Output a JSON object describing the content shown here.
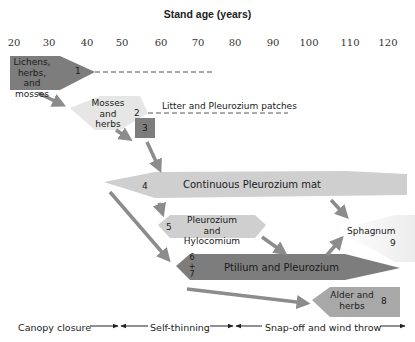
{
  "title": "Stand age (years)",
  "axis": {
    "ticks": [
      "20",
      "30",
      "40",
      "50",
      "60",
      "70",
      "80",
      "90",
      "100",
      "110",
      "120"
    ],
    "tick_x": [
      14,
      48,
      87,
      122,
      161,
      198,
      235,
      273,
      309,
      349,
      387
    ]
  },
  "colors": {
    "dark": "#7d7d7d",
    "medium": "#a8a8a8",
    "light": "#cfcfcf",
    "lightest": "#e6e6e6",
    "arrow": "#8c8c8c",
    "dashed": "#555555"
  },
  "stages": [
    {
      "id": "1",
      "label": "Lichens, herbs, and mosses",
      "number": "1",
      "shade": "dark"
    },
    {
      "id": "2",
      "label": "Mosses and herbs",
      "number": "2",
      "shade": "lightest"
    },
    {
      "id": "3",
      "label": "Litter and Pleurozium patches",
      "number": "3",
      "shade": "dark"
    },
    {
      "id": "4",
      "label": "Continuous Pleurozium mat",
      "number": "4",
      "shade": "light"
    },
    {
      "id": "5",
      "label": "Pleurozium and Hylocomium",
      "number": "5",
      "shade": "light"
    },
    {
      "id": "6+7",
      "label": "Ptilium and Pleurozium",
      "number": "6 + 7",
      "shade": "dark"
    },
    {
      "id": "8",
      "label": "Alder and herbs",
      "number": "8",
      "shade": "medium"
    },
    {
      "id": "9",
      "label": "Sphagnum",
      "number": "9",
      "shade": "lightest"
    }
  ],
  "phases": [
    {
      "label": "Canopy closure"
    },
    {
      "label": "Self-thinning"
    },
    {
      "label": "Snap-off and wind throw"
    }
  ]
}
